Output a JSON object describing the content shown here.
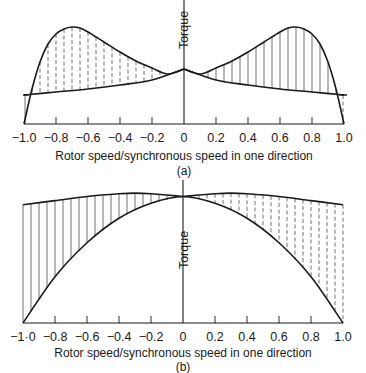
{
  "chart_data": [
    {
      "id": "a",
      "type": "line",
      "caption": "(a)",
      "xlabel": "Rotor speed/synchronous speed in one direction",
      "ylabel": "Torque",
      "xlim": [
        -1.0,
        1.0
      ],
      "ylim": [
        0,
        1.0
      ],
      "xticks": [
        -1.0,
        -0.8,
        -0.6,
        -0.4,
        -0.2,
        0,
        0.2,
        0.4,
        0.6,
        0.8,
        1.0
      ],
      "xtick_labels": [
        "−1.0",
        "−0.8",
        "−0.6",
        "−0.4",
        "−0.2",
        "0",
        "0.2",
        "0.4",
        "0.6",
        "0.8",
        "1.0"
      ],
      "series": [
        {
          "name": "upper-curve",
          "x": [
            -1.0,
            -0.95,
            -0.9,
            -0.85,
            -0.8,
            -0.75,
            -0.7,
            -0.65,
            -0.6,
            -0.5,
            -0.4,
            -0.3,
            -0.2,
            -0.1,
            0,
            0.1,
            0.2,
            0.3,
            0.4,
            0.5,
            0.6,
            0.65,
            0.7,
            0.75,
            0.8,
            0.85,
            0.9,
            0.95,
            1.0
          ],
          "y": [
            0.0,
            0.35,
            0.62,
            0.8,
            0.9,
            0.95,
            0.97,
            0.96,
            0.92,
            0.82,
            0.72,
            0.63,
            0.56,
            0.5,
            0.55,
            0.5,
            0.56,
            0.63,
            0.72,
            0.82,
            0.92,
            0.96,
            0.97,
            0.95,
            0.9,
            0.8,
            0.62,
            0.35,
            0.0
          ]
        },
        {
          "name": "lower-curve",
          "x": [
            -1.0,
            -0.8,
            -0.6,
            -0.4,
            -0.2,
            0,
            0.2,
            0.4,
            0.6,
            0.8,
            1.0
          ],
          "y": [
            0.29,
            0.32,
            0.35,
            0.39,
            0.44,
            0.55,
            0.44,
            0.39,
            0.35,
            0.32,
            0.29
          ]
        }
      ],
      "hatch": {
        "left": "dashed",
        "right": "solid"
      }
    },
    {
      "id": "b",
      "type": "line",
      "caption": "(b)",
      "xlabel": "Rotor speed/synchronous speed in one direction",
      "ylabel": "Torque",
      "xlim": [
        -1.0,
        1.0
      ],
      "ylim": [
        0,
        1.0
      ],
      "xticks": [
        -1.0,
        -0.8,
        -0.6,
        -0.4,
        -0.2,
        0,
        0.2,
        0.4,
        0.6,
        0.8,
        1.0
      ],
      "xtick_labels": [
        "−1·0",
        "−0.8",
        "−0.6",
        "−0.4",
        "−0.2",
        "0",
        "0.2",
        "0.4",
        "0.6",
        "0.8",
        "1.0"
      ],
      "series": [
        {
          "name": "upper-curve",
          "x": [
            -1.0,
            -0.8,
            -0.6,
            -0.4,
            -0.3,
            -0.2,
            0,
            0.2,
            0.3,
            0.4,
            0.6,
            0.8,
            1.0
          ],
          "y": [
            0.87,
            0.9,
            0.93,
            0.95,
            0.955,
            0.95,
            0.93,
            0.95,
            0.955,
            0.95,
            0.93,
            0.9,
            0.87
          ]
        },
        {
          "name": "lower-curve",
          "x": [
            -1.0,
            -0.8,
            -0.6,
            -0.4,
            -0.2,
            0,
            0.2,
            0.4,
            0.6,
            0.8,
            1.0
          ],
          "y": [
            0.0,
            0.34,
            0.59,
            0.77,
            0.88,
            0.93,
            0.88,
            0.77,
            0.59,
            0.34,
            0.0
          ]
        }
      ],
      "hatch": {
        "left": "solid",
        "right": "dashed"
      }
    }
  ]
}
